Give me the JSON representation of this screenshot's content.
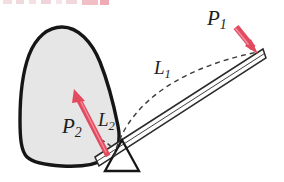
{
  "figure": {
    "name": "lever-fulcrum-force-diagram",
    "width": 284,
    "height": 182,
    "background_color": "#ffffff"
  },
  "labels": {
    "p1": {
      "base": "P",
      "sub": "1"
    },
    "p2": {
      "base": "P",
      "sub": "2"
    },
    "l1": {
      "base": "L",
      "sub": "1"
    },
    "l2": {
      "base": "L",
      "sub": "2"
    }
  },
  "colors": {
    "arrow": "#e24a60",
    "arrow_shade": "#f08a98",
    "outline": "#161616",
    "body_fill": "#e6e6e6",
    "bar_fill": "#fdfdfd",
    "dashed": "#3a3a3a",
    "artifact": "#e9a8b2"
  },
  "elements": {
    "body_blob": "rigid-body-blob",
    "lever_bar": "lever-bar",
    "fulcrum": "fulcrum-triangle",
    "arc_l1": "dashed-arc-l1",
    "arc_l2": "dashed-arc-l2",
    "arrow_p1": "force-arrow-p1",
    "arrow_p2": "force-arrow-p2"
  },
  "geometry": {
    "bar_left_end": [
      96,
      162
    ],
    "bar_right_end": [
      264,
      54
    ],
    "fulcrum_apex": [
      122,
      141
    ],
    "fulcrum_base_left": [
      108,
      170
    ],
    "fulcrum_base_right": [
      138,
      170
    ]
  }
}
